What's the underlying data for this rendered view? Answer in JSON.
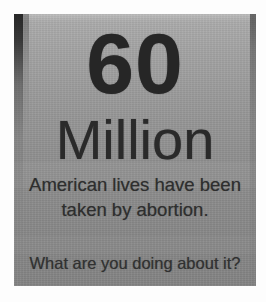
{
  "photo": {
    "subject": "printed pro-life flyer photographed on a wall",
    "frame_color": "#fdfdfd"
  },
  "poster": {
    "background_color": "#989898",
    "text_color": "#2b2b2b",
    "headline": {
      "number": "60",
      "unit": "Million"
    },
    "body_lines": [
      "American lives have been",
      "taken by abortion."
    ],
    "call_to_action": "What are you doing about it?"
  }
}
